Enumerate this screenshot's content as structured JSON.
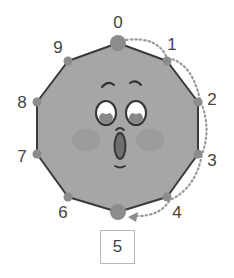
{
  "diagram": {
    "shape": "decagon-face",
    "colors": {
      "fill": "#a6a6a6",
      "outline": "#3a3a3a",
      "vertex_dot": "#8c8c8c",
      "dotted_path": "#9a9a9a",
      "cheek": "#999999",
      "mouth": "#6e6e6e"
    },
    "vertices": [
      {
        "label": "0",
        "x": 118,
        "y": 43,
        "big": true,
        "lx": 118,
        "ly": 22
      },
      {
        "label": "1",
        "x": 167,
        "y": 61,
        "big": false,
        "lx": 172,
        "ly": 44
      },
      {
        "label": "2",
        "x": 198,
        "y": 102,
        "big": false,
        "lx": 212,
        "ly": 99
      },
      {
        "label": "3",
        "x": 198,
        "y": 154,
        "big": false,
        "lx": 212,
        "ly": 160
      },
      {
        "label": "4",
        "x": 167,
        "y": 197,
        "big": false,
        "lx": 177,
        "ly": 212
      },
      {
        "label": "5",
        "x": 118,
        "y": 212,
        "big": true,
        "lx": null,
        "ly": null
      },
      {
        "label": "6",
        "x": 68,
        "y": 197,
        "big": false,
        "lx": 63,
        "ly": 212
      },
      {
        "label": "7",
        "x": 37,
        "y": 154,
        "big": false,
        "lx": 22,
        "ly": 156
      },
      {
        "label": "8",
        "x": 37,
        "y": 102,
        "big": false,
        "lx": 22,
        "ly": 102
      },
      {
        "label": "9",
        "x": 68,
        "y": 61,
        "big": false,
        "lx": 58,
        "ly": 47
      }
    ],
    "path": {
      "from": "0",
      "to": "5",
      "direction": "clockwise",
      "style": "dotted-arrow",
      "steps": 5
    },
    "answer": "5"
  }
}
